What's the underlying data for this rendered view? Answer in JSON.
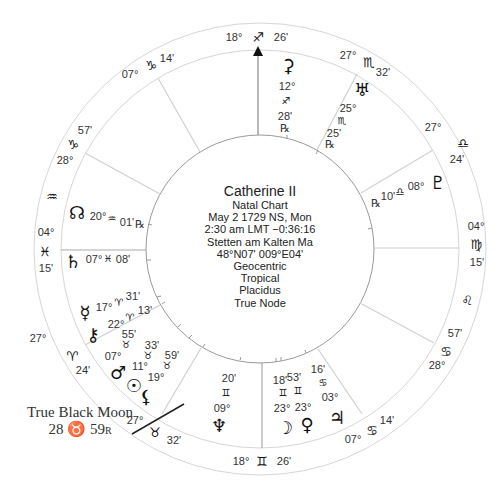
{
  "chart_info": {
    "name": "Catherine II",
    "type": "Natal Chart",
    "date": "May 2 1729 NS, Mon",
    "time": "2:30 am  LMT −0:36:16",
    "place": "Stetten am Kalten Ma",
    "coords": "48°N07' 009°E04'",
    "zodiac_view": "Geocentric",
    "zodiac": "Tropical",
    "houses": "Placidus",
    "node": "True Node"
  },
  "house_cusps": [
    {
      "house": "MC",
      "deg": "18°",
      "sign": "sagittarius",
      "glyph": "♐",
      "min": "26'"
    },
    {
      "house": "11",
      "deg": "07°",
      "sign": "capricorn",
      "glyph": "♑",
      "min": "14'"
    },
    {
      "house": "12",
      "deg": "28°",
      "sign": "capricorn",
      "glyph": "♑",
      "min": "57'"
    },
    {
      "house": "ASC",
      "deg": "04°",
      "sign": "pisces",
      "glyph": "♓",
      "min": "15'"
    },
    {
      "house": "2",
      "deg": "27°",
      "sign": "aries",
      "glyph": "♈",
      "min": "24'"
    },
    {
      "house": "3",
      "deg": "27°",
      "sign": "taurus",
      "glyph": "♉",
      "min": "32'"
    },
    {
      "house": "IC",
      "deg": "18°",
      "sign": "gemini",
      "glyph": "♊",
      "min": "26'"
    },
    {
      "house": "5",
      "deg": "07°",
      "sign": "cancer",
      "glyph": "♋",
      "min": "14'"
    },
    {
      "house": "6",
      "deg": "28°",
      "sign": "cancer",
      "glyph": "♋",
      "min": "57'"
    },
    {
      "house": "DSC",
      "deg": "04°",
      "sign": "virgo",
      "glyph": "♍",
      "min": "15'"
    },
    {
      "house": "8",
      "deg": "27°",
      "sign": "libra",
      "glyph": "♎",
      "min": "24'"
    },
    {
      "house": "9",
      "deg": "27°",
      "sign": "scorpio",
      "glyph": "♏",
      "min": "32'"
    }
  ],
  "intercepted_signs": [
    {
      "sign": "aquarius",
      "glyph": "♒"
    },
    {
      "sign": "leo",
      "glyph": "♌"
    }
  ],
  "planets": [
    {
      "name": "ceres",
      "glyph": "⚳",
      "deg": "12°",
      "sign_glyph": "♐",
      "min": "28'",
      "retro": "℞"
    },
    {
      "name": "uranus",
      "glyph": "♅",
      "deg": "25°",
      "sign_glyph": "♏",
      "min": "25'",
      "retro": "℞"
    },
    {
      "name": "pluto",
      "glyph": "♇",
      "deg": "08°",
      "sign_glyph": "♎",
      "min": "10'",
      "retro": "℞"
    },
    {
      "name": "north-node",
      "glyph": "☊",
      "deg": "20°",
      "sign_glyph": "♒",
      "min": "01'",
      "retro": "℞"
    },
    {
      "name": "saturn",
      "glyph": "♄",
      "deg": "07°",
      "sign_glyph": "♓",
      "min": "08'",
      "retro": ""
    },
    {
      "name": "mercury",
      "glyph": "☿",
      "deg": "17°",
      "sign_glyph": "♈",
      "min": "31'",
      "retro": ""
    },
    {
      "name": "chiron",
      "glyph": "⚷",
      "deg": "22°",
      "sign_glyph": "♈",
      "min": "13'",
      "retro": ""
    },
    {
      "name": "mars",
      "glyph": "♂",
      "deg": "07°",
      "sign_glyph": "♉",
      "min": "55'",
      "retro": ""
    },
    {
      "name": "sun",
      "glyph": "☉",
      "deg": "11°",
      "sign_glyph": "♉",
      "min": "33'",
      "retro": ""
    },
    {
      "name": "lilith",
      "glyph": "⚸",
      "deg": "19°",
      "sign_glyph": "♉",
      "min": "59'",
      "retro": ""
    },
    {
      "name": "neptune",
      "glyph": "♆",
      "deg": "09°",
      "sign_glyph": "♊",
      "min": "20'",
      "retro": ""
    },
    {
      "name": "moon",
      "glyph": "☽",
      "deg": "23°",
      "sign_glyph": "♊",
      "min": "18'",
      "retro": ""
    },
    {
      "name": "venus",
      "glyph": "♀",
      "deg": "23°",
      "sign_glyph": "♊",
      "min": "53'",
      "retro": ""
    },
    {
      "name": "jupiter",
      "glyph": "♃",
      "deg": "03°",
      "sign_glyph": "♋",
      "min": "16'",
      "retro": ""
    }
  ],
  "black_moon": {
    "label": "True Black Moon",
    "position": "28 ♉ 59",
    "suffix": "R"
  }
}
